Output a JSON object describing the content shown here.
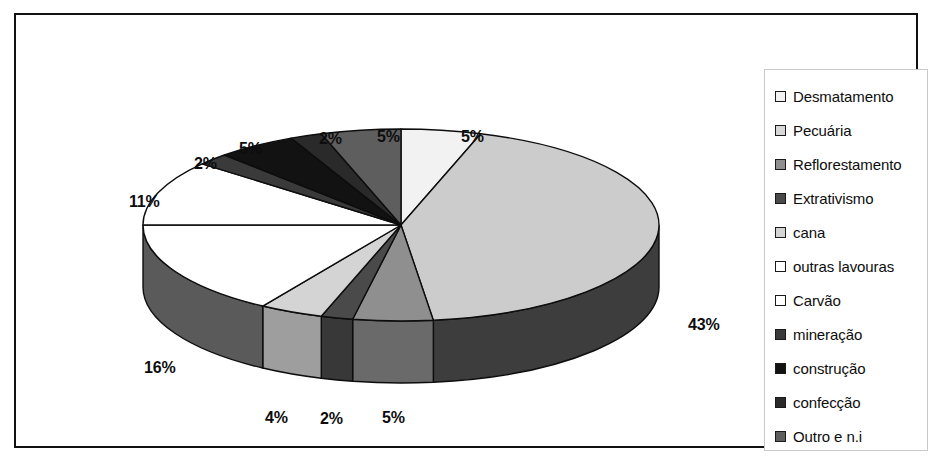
{
  "chart_data": {
    "type": "pie",
    "title": "",
    "subtitle": "",
    "xlabel": "",
    "ylabel": "",
    "three_d": true,
    "grid": false,
    "legend_position": "right",
    "start_angle_deg": 0,
    "direction": "clockwise",
    "value_unit": "%",
    "categories": [
      "Desmatamento",
      "Pecuária",
      "Reflorestamento",
      "Extrativismo",
      "cana",
      "outras lavouras",
      "Carvão",
      "mineração",
      "construção",
      "confecção",
      "Outro e n.i"
    ],
    "values": [
      5,
      43,
      5,
      2,
      4,
      16,
      11,
      2,
      5,
      2,
      5
    ],
    "labels": [
      "5%",
      "43%",
      "5%",
      "2%",
      "4%",
      "16%",
      "11%",
      "2%",
      "5%",
      "2%",
      "5%"
    ],
    "colors": [
      "#f2f2f2",
      "#cccccc",
      "#8f8f8f",
      "#4a4a4a",
      "#d4d4d4",
      "#ffffff",
      "#ffffff",
      "#3a3a3a",
      "#121212",
      "#2a2a2a",
      "#5e5e5e"
    ],
    "side_colors": [
      "#b8b8b8",
      "#3d3d3d",
      "#6a6a6a",
      "#383838",
      "#9e9e9e",
      "#5a5a5a",
      "#5a5a5a",
      "#2c2c2c",
      "#0d0d0d",
      "#1f1f1f",
      "#474747"
    ]
  },
  "legend": {
    "items": [
      {
        "label": "Desmatamento",
        "swatch": "#f2f2f2"
      },
      {
        "label": "Pecuária",
        "swatch": "#d8d8d8"
      },
      {
        "label": "Reflorestamento",
        "swatch": "#8f8f8f"
      },
      {
        "label": "Extrativismo",
        "swatch": "#4a4a4a"
      },
      {
        "label": "cana",
        "swatch": "#d4d4d4"
      },
      {
        "label": "outras lavouras",
        "swatch": "#ffffff"
      },
      {
        "label": "Carvão",
        "swatch": "#ffffff"
      },
      {
        "label": "mineração",
        "swatch": "#3a3a3a"
      },
      {
        "label": "construção",
        "swatch": "#121212"
      },
      {
        "label": "confecção",
        "swatch": "#2a2a2a"
      },
      {
        "label": "Outro e n.i",
        "swatch": "#5e5e5e"
      }
    ]
  },
  "data_labels": [
    {
      "text": "5%",
      "name": "pct-label-desmatamento",
      "left": 425,
      "top": 93
    },
    {
      "text": "43%",
      "name": "pct-label-pecuaria",
      "left": 652,
      "top": 281
    },
    {
      "text": "5%",
      "name": "pct-label-outro-e-ni",
      "left": 341,
      "top": 93
    },
    {
      "text": "2%",
      "name": "pct-label-confeccao",
      "left": 283,
      "top": 95
    },
    {
      "text": "5%",
      "name": "pct-label-construcao",
      "left": 203,
      "top": 105
    },
    {
      "text": "2%",
      "name": "pct-label-mineracao",
      "left": 158,
      "top": 120
    },
    {
      "text": "11%",
      "name": "pct-label-carvao",
      "left": 93,
      "top": 158
    },
    {
      "text": "16%",
      "name": "pct-label-outras-lavouras",
      "left": 108,
      "top": 324
    },
    {
      "text": "4%",
      "name": "pct-label-cana",
      "left": 229,
      "top": 374
    },
    {
      "text": "2%",
      "name": "pct-label-extrativismo",
      "left": 284,
      "top": 375
    },
    {
      "text": "5%",
      "name": "pct-label-reflorestamento",
      "left": 346,
      "top": 374
    }
  ],
  "geometry": {
    "center_x": 365,
    "center_y": 190,
    "radius_x": 258,
    "radius_y": 96,
    "depth": 62
  }
}
